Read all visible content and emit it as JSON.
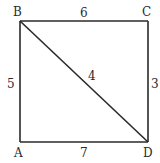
{
  "diagram": {
    "vertices": {
      "A": {
        "label": "A",
        "x": 20,
        "y": 142
      },
      "B": {
        "label": "B",
        "x": 20,
        "y": 21
      },
      "C": {
        "label": "C",
        "x": 148,
        "y": 21
      },
      "D": {
        "label": "D",
        "x": 148,
        "y": 142
      }
    },
    "edges": [
      {
        "from": "B",
        "to": "C",
        "weight": "6"
      },
      {
        "from": "C",
        "to": "D",
        "weight": "3"
      },
      {
        "from": "A",
        "to": "D",
        "weight": "7"
      },
      {
        "from": "A",
        "to": "B",
        "weight": "5"
      },
      {
        "from": "B",
        "to": "D",
        "weight": "4"
      }
    ],
    "stroke_color": "#2a2a2a"
  }
}
